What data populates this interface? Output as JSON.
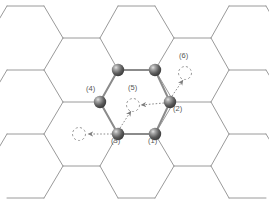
{
  "figure": {
    "kind": "honeycomb-lattice-diagram",
    "title": "",
    "background_color": "#ffffff",
    "width": 269,
    "height": 204,
    "lattice": {
      "line_color": "#9a9a9a",
      "bond_color": "#7a7a7a",
      "line_width": 1,
      "bond_width": 2,
      "a_horizontal": 37,
      "period_x": 111,
      "period_y": 64
    },
    "atom_style": {
      "fill_dark": "#3f3f3f",
      "fill_mid": "#6e6e6e",
      "highlight": "#d8d8d8",
      "radius": 6.2
    },
    "arrow_style": {
      "color": "#8c8c8c",
      "dash": "1.6 1.8",
      "circle_dash": "2.2 2.2"
    }
  },
  "atoms": [
    {
      "id": "a1",
      "label": "(1)",
      "x": 155,
      "y": 134,
      "label_x": 148,
      "label_y": 141
    },
    {
      "id": "a2",
      "label": "(2)",
      "x": 170,
      "y": 102,
      "label_x": 172,
      "label_y": 109
    },
    {
      "id": "a3",
      "label": "(3)",
      "x": 118,
      "y": 134,
      "label_x": 112,
      "label_y": 141
    },
    {
      "id": "a4",
      "label": "(4)",
      "x": 100,
      "y": 102,
      "label_x": 87,
      "label_y": 88
    },
    {
      "id": "a5",
      "label": "",
      "x": 118,
      "y": 70,
      "label_x": 0,
      "label_y": 0
    },
    {
      "id": "a6",
      "label": "",
      "x": 155,
      "y": 70,
      "label_x": 0,
      "label_y": 0
    }
  ],
  "markers": [
    {
      "id": "m5",
      "label": "(5)",
      "label_x": 132,
      "label_y": 87,
      "circle_x": 133,
      "circle_y": 105,
      "r": 6.5
    },
    {
      "id": "m6",
      "label": "(6)",
      "label_x": 181,
      "label_y": 55,
      "circle_x": 185,
      "circle_y": 73,
      "r": 6.5
    },
    {
      "id": "m7",
      "label": "",
      "label_x": 0,
      "label_y": 0,
      "circle_x": 79,
      "circle_y": 134,
      "r": 6.5
    }
  ],
  "arrows": [
    {
      "id": "arrow-left-from-3",
      "x1": 112,
      "y1": 134,
      "x2": 86,
      "y2": 134,
      "head": true
    },
    {
      "id": "arrow-left-from-2",
      "x1": 164,
      "y1": 103,
      "x2": 140,
      "y2": 105,
      "head": true
    },
    {
      "id": "arrow-up-from-3",
      "x1": 120,
      "y1": 128,
      "x2": 131,
      "y2": 110,
      "head": true
    },
    {
      "id": "arrow-upright-from-2",
      "x1": 172,
      "y1": 96,
      "x2": 183,
      "y2": 79,
      "head": true
    }
  ],
  "accessibility": {
    "description": "Hexagonal honeycomb lattice with six highlighted atoms labelled (1) through (4) and two dashed-circle vacancy markers labelled (5) and (6), connected by dotted hopping arrows."
  }
}
